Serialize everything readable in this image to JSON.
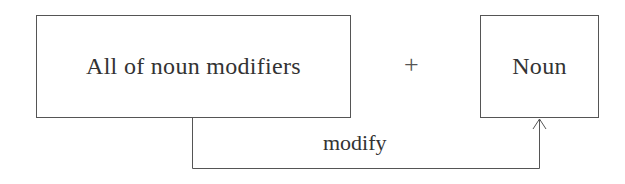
{
  "diagram": {
    "left_box": {
      "label": "All of noun modifiers"
    },
    "operator": {
      "symbol": "+"
    },
    "right_box": {
      "label": "Noun"
    },
    "connector": {
      "label": "modify",
      "from": "All of noun modifiers",
      "to": "Noun"
    }
  },
  "colors": {
    "stroke": "#555555",
    "text": "#333333",
    "background": "#ffffff"
  }
}
